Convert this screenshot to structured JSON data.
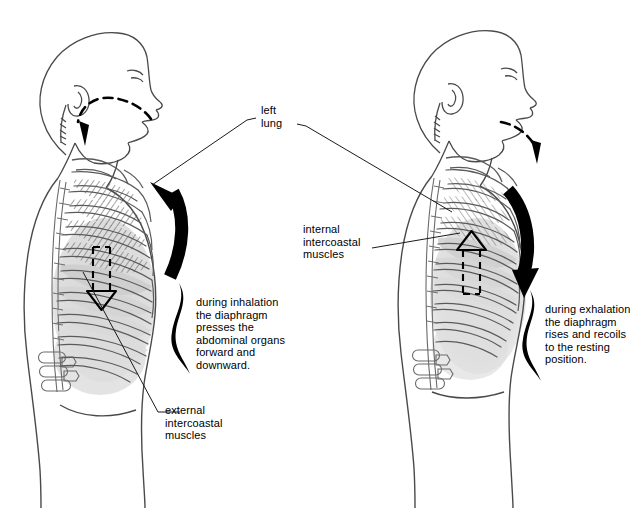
{
  "figure": {
    "type": "anatomical-diagram",
    "background_color": "#ffffff",
    "line_color": "#4a4a4a",
    "ink_color": "#000000",
    "shade_color": "#d5d5d5",
    "hatch_color": "#555555"
  },
  "labels": {
    "left_lung": "left\nlung",
    "internal_intercostal": "internal\nintercoastal\nmuscles",
    "external_intercostal": "external\nintercoastal\nmuscles",
    "inhalation_caption": "during inhalation\nthe diaphragm\npresses the\nabdominal organs\nforward and\ndownward.",
    "exhalation_caption": "during exhalation\nthe diaphragm\nrises and recoils\nto the resting\nposition."
  },
  "panels": [
    {
      "id": "left-panel",
      "phase": "inhalation",
      "airflow_direction": "inward",
      "diaphragm_arrow_direction": "down",
      "chest_arrow_direction": "up",
      "abdomen_state": "protruding",
      "caption_key": "inhalation_caption"
    },
    {
      "id": "right-panel",
      "phase": "exhalation",
      "airflow_direction": "outward",
      "diaphragm_arrow_direction": "up",
      "chest_arrow_direction": "down",
      "abdomen_state": "resting",
      "caption_key": "exhalation_caption"
    }
  ],
  "icons": {
    "airflow": "dashed-airflow-arrow-icon",
    "diaphragm": "dashed-outline-arrow-icon",
    "chest": "thick-curved-arrow-icon",
    "brace": "curly-brace-icon",
    "leader": "leader-line-icon"
  }
}
